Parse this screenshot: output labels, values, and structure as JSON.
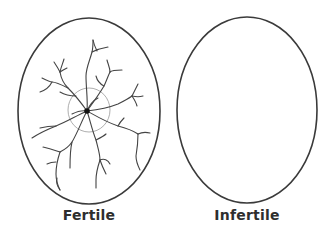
{
  "diagram": {
    "eggs": [
      {
        "label": "Fertile",
        "features": [
          "egg-outline",
          "blood-vessels",
          "embryo-dot",
          "faint-ring"
        ]
      },
      {
        "label": "Infertile",
        "features": [
          "egg-outline"
        ]
      }
    ],
    "colors": {
      "outline": "#3a3a3a",
      "vessels": "#444444",
      "ring": "#9a9a9a",
      "embryo": "#111111",
      "label": "#2e2e2e",
      "background": "#ffffff"
    }
  }
}
